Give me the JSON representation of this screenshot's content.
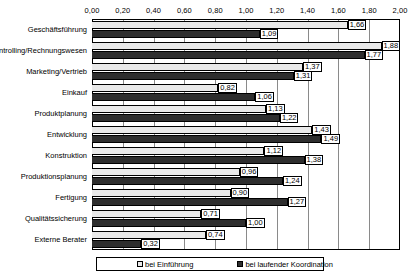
{
  "chart_data": {
    "type": "bar",
    "orientation": "horizontal",
    "title": "",
    "xlabel": "",
    "ylabel": "",
    "xlim": [
      0,
      2
    ],
    "xtick_step": 0.2,
    "grid": true,
    "decimal_separator": ",",
    "legend_position": "bottom",
    "xticks": [
      "0,00",
      "0,20",
      "0,40",
      "0,60",
      "0,80",
      "1,00",
      "1,20",
      "1,40",
      "1,60",
      "1,80",
      "2,00"
    ],
    "xtick_values": [
      0,
      0.2,
      0.4,
      0.6,
      0.8,
      1.0,
      1.2,
      1.4,
      1.6,
      1.8,
      2.0
    ],
    "categories": [
      "Geschäftsführung",
      "Controlling/Rechnungswesen",
      "Marketing/Vertrieb",
      "Einkauf",
      "Produktplanung",
      "Entwicklung",
      "Konstruktion",
      "Produktionsplanung",
      "Fertigung",
      "Qualitätssicherung",
      "Externe Berater"
    ],
    "series": [
      {
        "name": "bei Einführung",
        "color": "#e9e9e9",
        "values": [
          1.66,
          1.88,
          1.37,
          0.82,
          1.13,
          1.43,
          1.12,
          0.96,
          0.9,
          0.71,
          0.74
        ],
        "labels": [
          "1,66",
          "1,88",
          "1,37",
          "0,82",
          "1,13",
          "1,43",
          "1,12",
          "0,96",
          "0,90",
          "0,71",
          "0,74"
        ]
      },
      {
        "name": "bei laufender Koordination",
        "color": "#2e2e2e",
        "values": [
          1.09,
          1.77,
          1.31,
          1.06,
          1.22,
          1.49,
          1.38,
          1.24,
          1.27,
          1.0,
          0.32
        ],
        "labels": [
          "1,09",
          "1,77",
          "1,31",
          "1,06",
          "1,22",
          "1,49",
          "1,38",
          "1,24",
          "1,27",
          "1,00",
          "0,32"
        ]
      }
    ]
  },
  "legend": {
    "entries": [
      {
        "label": "bei Einführung"
      },
      {
        "label": "bei laufender Koordination"
      }
    ]
  }
}
